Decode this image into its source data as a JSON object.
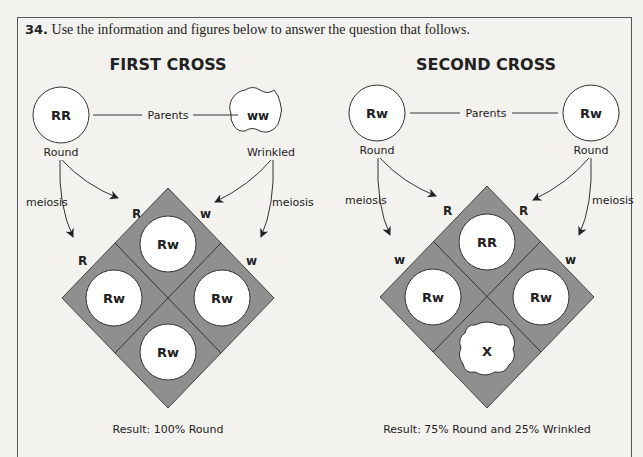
{
  "question": {
    "number": "34.",
    "text": "Use the information and figures below to answer the question that follows."
  },
  "crosses": [
    {
      "title": "FIRST CROSS",
      "parents_label": "Parents",
      "parent_left": {
        "genotype": "RR",
        "phenotype": "Round",
        "shape": "round"
      },
      "parent_right": {
        "genotype": "ww",
        "phenotype": "Wrinkled",
        "shape": "wrinkled"
      },
      "meiosis_left": "meiosis",
      "meiosis_right": "meiosis",
      "gametes": {
        "top_left": "R",
        "top_right": "w",
        "left": "R",
        "right": "w"
      },
      "offspring": {
        "top": "Rw",
        "left": "Rw",
        "right": "Rw",
        "bottom": "Rw"
      },
      "result": "Result: 100% Round"
    },
    {
      "title": "SECOND CROSS",
      "parents_label": "Parents",
      "parent_left": {
        "genotype": "Rw",
        "phenotype": "Round",
        "shape": "round"
      },
      "parent_right": {
        "genotype": "Rw",
        "phenotype": "Round",
        "shape": "round"
      },
      "meiosis_left": "meiosis",
      "meiosis_right": "meiosis",
      "gametes": {
        "top_left": "R",
        "top_right": "R",
        "left": "w",
        "right": "w"
      },
      "offspring": {
        "top": "RR",
        "left": "Rw",
        "right": "Rw",
        "bottom": "X"
      },
      "result": "Result: 75% Round and 25% Wrinkled"
    }
  ],
  "colors": {
    "grid_fill": "#8f8f8f",
    "line": "#333333",
    "background": "#f3f2ef"
  }
}
